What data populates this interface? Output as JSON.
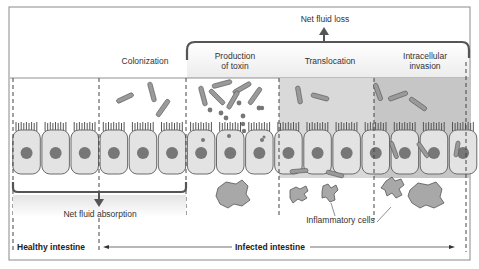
{
  "diagram": {
    "top_label": "Net fluid loss",
    "stages": [
      {
        "id": "colonization",
        "label": "Colonization"
      },
      {
        "id": "toxin",
        "label_line1": "Production",
        "label_line2": "of toxin"
      },
      {
        "id": "translocation",
        "label": "Translocation"
      },
      {
        "id": "invasion",
        "label_line1": "Intracellular",
        "label_line2": "invasion"
      }
    ],
    "bottom_left_label": "Net fluid absorption",
    "inflammatory_label": "Inflammatory cells",
    "healthy_label": "Healthy intestine",
    "infected_label": "Infected intestine",
    "colors": {
      "cell_fill": "#e3e3e3",
      "cell_stroke": "#6a6a6a",
      "nucleus": "#777777",
      "bacteria": "#9a9a9a",
      "translocation_bg": "#d8d8d8",
      "invasion_bg": "#c4c4c4",
      "frame": "#888888",
      "bracket": "#555555"
    }
  }
}
